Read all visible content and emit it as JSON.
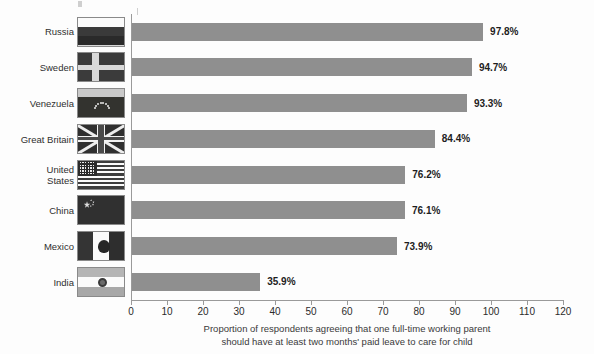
{
  "chart_data": {
    "type": "bar",
    "orientation": "horizontal",
    "title": "",
    "xlabel": "Proportion of respondents agreeing that one full-time working parent should have at least two months' paid leave to care for child",
    "ylabel": "",
    "xlim": [
      0,
      120
    ],
    "xticks": [
      0,
      10,
      20,
      30,
      40,
      50,
      60,
      70,
      80,
      90,
      100,
      110,
      120
    ],
    "grid": false,
    "legend": false,
    "bar_color": "#8f8f8f",
    "categories": [
      "Russia",
      "Sweden",
      "Venezuela",
      "Great Britain",
      "United States",
      "China",
      "Mexico",
      "India"
    ],
    "values": [
      97.8,
      94.7,
      93.3,
      84.4,
      76.2,
      76.1,
      73.9,
      35.9
    ],
    "value_labels": [
      "97.8%",
      "94.7%",
      "93.3%",
      "84.4%",
      "76.2%",
      "76.1%",
      "73.9%",
      "35.9%"
    ]
  },
  "caption": {
    "line1": "Proportion of respondents agreeing that one full-time working parent",
    "line2": "should have at least two months' paid leave to care for child"
  },
  "rows": [
    {
      "label": "Russia",
      "flag": "flag-russia",
      "value": 97.8,
      "value_label": "97.8%"
    },
    {
      "label": "Sweden",
      "flag": "flag-sweden",
      "value": 94.7,
      "value_label": "94.7%"
    },
    {
      "label": "Venezuela",
      "flag": "flag-venezuela",
      "value": 93.3,
      "value_label": "93.3%"
    },
    {
      "label": "Great Britain",
      "flag": "flag-great-britain",
      "value": 84.4,
      "value_label": "84.4%"
    },
    {
      "label": "United\nStates",
      "flag": "flag-united-states",
      "value": 76.2,
      "value_label": "76.2%"
    },
    {
      "label": "China",
      "flag": "flag-china",
      "value": 76.1,
      "value_label": "76.1%"
    },
    {
      "label": "Mexico",
      "flag": "flag-mexico",
      "value": 73.9,
      "value_label": "73.9%"
    },
    {
      "label": "India",
      "flag": "flag-india",
      "value": 35.9,
      "value_label": "35.9%"
    }
  ],
  "axis": {
    "ticks": [
      "0",
      "10",
      "20",
      "30",
      "40",
      "50",
      "60",
      "70",
      "80",
      "90",
      "100",
      "110",
      "120"
    ]
  }
}
